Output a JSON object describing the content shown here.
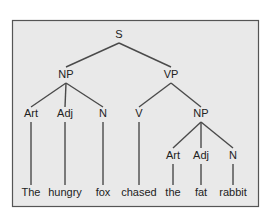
{
  "diagram": {
    "type": "syntax-tree",
    "colors": {
      "background": "#ffffff",
      "panel": "#e9e9e9",
      "border": "#555555",
      "line": "#4a4a4a",
      "text": "#222222"
    },
    "nodes": {
      "s": {
        "label": "S",
        "x": 119,
        "y": 35
      },
      "np1": {
        "label": "NP",
        "x": 66,
        "y": 75
      },
      "vp": {
        "label": "VP",
        "x": 171,
        "y": 75
      },
      "art1": {
        "label": "Art",
        "x": 31,
        "y": 114
      },
      "adj1": {
        "label": "Adj",
        "x": 65,
        "y": 114
      },
      "n1": {
        "label": "N",
        "x": 103,
        "y": 114
      },
      "v": {
        "label": "V",
        "x": 139,
        "y": 114
      },
      "np2": {
        "label": "NP",
        "x": 201,
        "y": 114
      },
      "art2": {
        "label": "Art",
        "x": 173,
        "y": 156
      },
      "adj2": {
        "label": "Adj",
        "x": 201,
        "y": 156
      },
      "n2": {
        "label": "N",
        "x": 233,
        "y": 156
      }
    },
    "words": {
      "w1": {
        "label": "The",
        "x": 31,
        "y": 193
      },
      "w2": {
        "label": "hungry",
        "x": 65,
        "y": 193
      },
      "w3": {
        "label": "fox",
        "x": 103,
        "y": 193
      },
      "w4": {
        "label": "chased",
        "x": 139,
        "y": 193
      },
      "w5": {
        "label": "the",
        "x": 173,
        "y": 193
      },
      "w6": {
        "label": "fat",
        "x": 201,
        "y": 193
      },
      "w7": {
        "label": "rabbit",
        "x": 233,
        "y": 193
      }
    },
    "edges": [
      [
        "S",
        "NP"
      ],
      [
        "S",
        "VP"
      ],
      [
        "NP",
        "Art"
      ],
      [
        "NP",
        "Adj"
      ],
      [
        "NP",
        "N"
      ],
      [
        "VP",
        "V"
      ],
      [
        "VP",
        "NP"
      ],
      [
        "NP",
        "Art"
      ],
      [
        "NP",
        "Adj"
      ],
      [
        "NP",
        "N"
      ],
      [
        "Art",
        "The"
      ],
      [
        "Adj",
        "hungry"
      ],
      [
        "N",
        "fox"
      ],
      [
        "V",
        "chased"
      ],
      [
        "Art",
        "the"
      ],
      [
        "Adj",
        "fat"
      ],
      [
        "N",
        "rabbit"
      ]
    ]
  }
}
